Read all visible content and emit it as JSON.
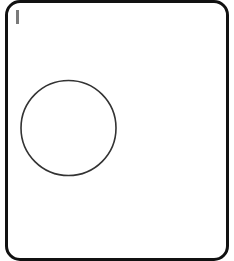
{
  "canvas": {
    "background_color": "#ffffff",
    "frame_border_color": "#111111",
    "caret_color": "#7a7a7a"
  },
  "shapes": [
    {
      "type": "circle",
      "name": "circle-shape",
      "stroke_color": "#333333",
      "fill_color": "none"
    }
  ]
}
